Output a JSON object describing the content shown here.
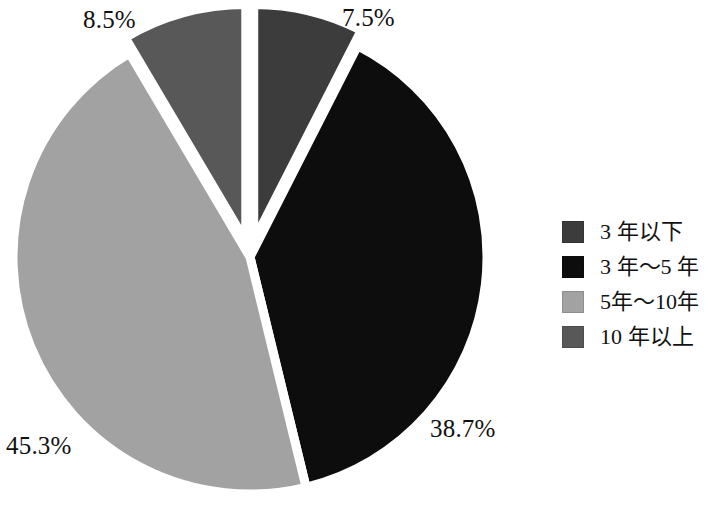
{
  "chart_data": {
    "type": "pie",
    "title": "",
    "subtitle": "",
    "xlabel": "",
    "ylabel": "",
    "grid": false,
    "legend_position": "right",
    "categories": [
      "3 年以下",
      "3 年～5 年",
      "5年～10年",
      "10 年以上"
    ],
    "values": [
      7.5,
      38.7,
      45.3,
      8.5
    ],
    "value_unit": "%",
    "data_labels": [
      "7.5%",
      "38.7%",
      "45.3%",
      "8.5%"
    ],
    "colors": [
      "#3c3c3c",
      "#0d0d0d",
      "#a2a2a2",
      "#585858"
    ],
    "exploded": [
      true,
      false,
      false,
      true
    ],
    "slices": [
      {
        "label": "3 年以下",
        "value": 7.5,
        "data_label": "7.5%",
        "color": "#3c3c3c",
        "exploded": true
      },
      {
        "label": "3 年～5 年",
        "value": 38.7,
        "data_label": "38.7%",
        "color": "#0d0d0d",
        "exploded": false
      },
      {
        "label": "5年～10年",
        "value": 45.3,
        "data_label": "45.3%",
        "color": "#a2a2a2",
        "exploded": false
      },
      {
        "label": "10 年以上",
        "value": 8.5,
        "data_label": "8.5%",
        "color": "#585858",
        "exploded": true
      }
    ]
  },
  "labels": {
    "pct_0": "8.5%",
    "pct_1": "7.5%",
    "pct_2": "38.7%",
    "pct_3": "45.3%"
  },
  "legend": {
    "items": [
      {
        "label": "3 年以下",
        "color": "#3c3c3c"
      },
      {
        "label": "3 年～5 年",
        "color": "#0d0d0d"
      },
      {
        "label": "5年～10年",
        "color": "#a2a2a2"
      },
      {
        "label": "10 年以上",
        "color": "#585858"
      }
    ]
  },
  "colors": {
    "background": "#ffffff",
    "text": "#111111",
    "slice_gap": "#ffffff"
  }
}
